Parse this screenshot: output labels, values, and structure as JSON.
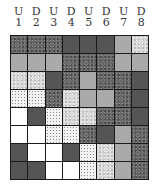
{
  "columns": [
    {
      "letter": "U",
      "number": "1"
    },
    {
      "letter": "D",
      "number": "2"
    },
    {
      "letter": "U",
      "number": "3"
    },
    {
      "letter": "D",
      "number": "4"
    },
    {
      "letter": "U",
      "number": "5"
    },
    {
      "letter": "D",
      "number": "6"
    },
    {
      "letter": "U",
      "number": "7"
    },
    {
      "letter": "D",
      "number": "8"
    }
  ],
  "legend_patterns": {
    "W": "white",
    "D": "sparse-dots",
    "S": "light-speckle",
    "G": "light-gray",
    "K": "dark-gray",
    "M": "dark-mottled"
  },
  "grid": [
    [
      "M",
      "M",
      "M",
      "K",
      "K",
      "K",
      "G",
      "S"
    ],
    [
      "G",
      "G",
      "G",
      "M",
      "M",
      "M",
      "G",
      "G"
    ],
    [
      "S",
      "S",
      "K",
      "M",
      "G",
      "M",
      "M",
      "K"
    ],
    [
      "D",
      "D",
      "M",
      "S",
      "G",
      "G",
      "M",
      "K"
    ],
    [
      "W",
      "K",
      "D",
      "S",
      "S",
      "M",
      "M",
      "K"
    ],
    [
      "W",
      "W",
      "D",
      "D",
      "M",
      "K",
      "G",
      "M"
    ],
    [
      "K",
      "W",
      "W",
      "K",
      "D",
      "S",
      "G",
      "M"
    ],
    [
      "K",
      "K",
      "W",
      "W",
      "D",
      "S",
      "G",
      "M"
    ]
  ]
}
